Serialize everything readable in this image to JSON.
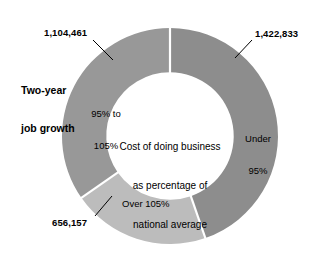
{
  "chart_data": {
    "type": "pie",
    "variant": "donut",
    "title": "Two-year job growth",
    "center_caption": "Cost of doing business as percentage of national average",
    "center_caption_lines": [
      "Cost of doing business",
      "as percentage of",
      "national average"
    ],
    "title_lines": [
      "Two-year",
      "job growth"
    ],
    "value_unit": "jobs",
    "total": 3183451,
    "categories": [
      "Under 95%",
      "Over 105%",
      "95% to 105%"
    ],
    "values": [
      1422833,
      656157,
      1104461
    ],
    "value_labels": [
      "1,422,833",
      "656,157",
      "1,104,461"
    ],
    "percentages": [
      44.7,
      20.6,
      34.7
    ],
    "colors": [
      "#8d8d8d",
      "#bcbcbc",
      "#989898"
    ],
    "start_angle_deg": 0,
    "direction": "clockwise",
    "inner_radius_ratio": 0.59,
    "legend": "none",
    "grid": false,
    "slices": [
      {
        "name": "Under 95%",
        "label_lines": [
          "Under",
          "95%"
        ],
        "value": 1422833,
        "value_label": "1,422,833",
        "percent": 44.7,
        "color": "#8d8d8d",
        "start_deg": 0,
        "end_deg": 161
      },
      {
        "name": "Over 105%",
        "label_lines": [
          "Over 105%"
        ],
        "value": 656157,
        "value_label": "656,157",
        "percent": 20.6,
        "color": "#bcbcbc",
        "start_deg": 161,
        "end_deg": 235
      },
      {
        "name": "95% to 105%",
        "label_lines": [
          "95% to",
          "105%"
        ],
        "value": 1104461,
        "value_label": "1,104,461",
        "percent": 34.7,
        "color": "#989898",
        "start_deg": 235,
        "end_deg": 360
      }
    ]
  },
  "labels": {
    "series_title_line1": "Two-year",
    "series_title_line2": "job growth",
    "value_under95": "1,422,833",
    "value_mid": "1,104,461",
    "value_over105": "656,157",
    "slice_under95_line1": "Under",
    "slice_under95_line2": "95%",
    "slice_mid_line1": "95% to",
    "slice_mid_line2": "105%",
    "slice_over105": "Over 105%",
    "center_line1": "Cost of doing business",
    "center_line2": "as percentage of",
    "center_line3": "national average"
  }
}
